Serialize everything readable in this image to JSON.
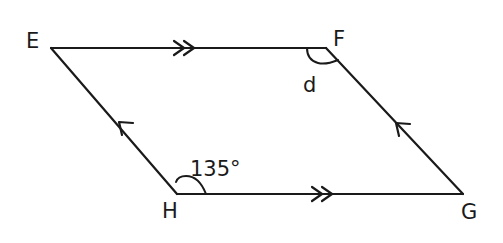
{
  "diagram": {
    "type": "parallelogram",
    "stroke_color": "#1a1a1a",
    "vertices": [
      {
        "name": "E",
        "label": "E",
        "x": 51,
        "y": 48
      },
      {
        "name": "F",
        "label": "F",
        "x": 326,
        "y": 48
      },
      {
        "name": "G",
        "label": "G",
        "x": 463,
        "y": 194
      },
      {
        "name": "H",
        "label": "H",
        "x": 177,
        "y": 194
      }
    ],
    "sides": [
      {
        "from": "E",
        "to": "F",
        "parallel_mark": "double-arrow"
      },
      {
        "from": "H",
        "to": "G",
        "parallel_mark": "double-arrow"
      },
      {
        "from": "H",
        "to": "E",
        "parallel_mark": "single-arrow"
      },
      {
        "from": "G",
        "to": "F",
        "parallel_mark": "single-arrow"
      }
    ],
    "angles": [
      {
        "vertex": "H",
        "label": "135°"
      },
      {
        "vertex": "F",
        "label": "d"
      }
    ]
  }
}
